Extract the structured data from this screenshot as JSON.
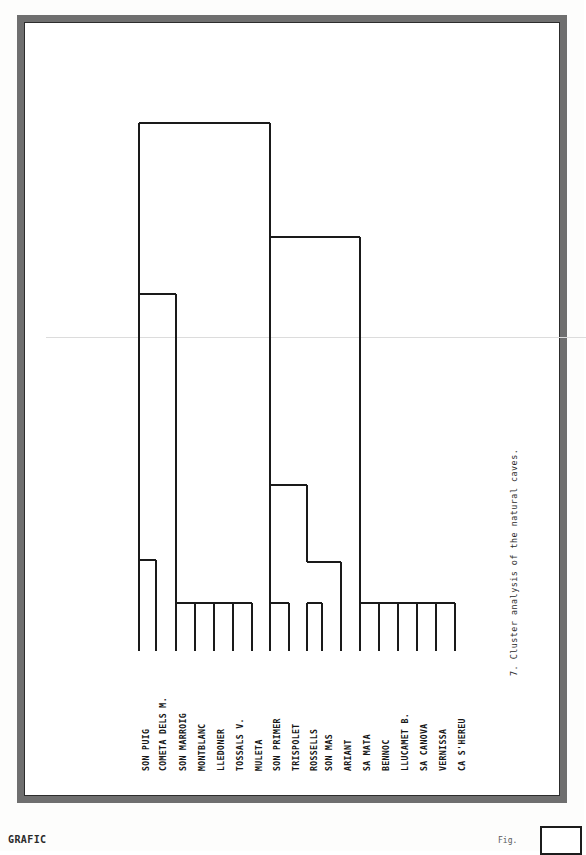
{
  "figure": {
    "caption": "7. Cluster analysis of the natural caves.",
    "leaf_label_count": "18"
  },
  "artifacts": {
    "left_text": "GRAFIC",
    "right_text": "Fig."
  },
  "chart_data": {
    "type": "dendrogram",
    "title": "7. Cluster analysis of the natural caves.",
    "xlabel": "",
    "ylabel": "",
    "grid": false,
    "legend": "none",
    "orientation": "leaves-at-bottom",
    "leaves": [
      "SON PUIG",
      "COMETA DELS M.",
      "SON MARROIG",
      "MONTBLANC",
      "LLEDONER",
      "TOSSALS V.",
      "MULETA",
      "SON PRIMER",
      "TRISPOLET",
      "ROSSELLS",
      "SON MAS",
      "ARIANT",
      "SA MATA",
      "BENNOC",
      "LLUCAMET B.",
      "SA CANOVA",
      "VERNISSA",
      "CA S'HEREU"
    ],
    "leaf_x": [
      91,
      108,
      128,
      147,
      166,
      185,
      204,
      222,
      241,
      259,
      274,
      293,
      312,
      331,
      350,
      369,
      388,
      407
    ],
    "baseline_y": 607,
    "merges": [
      {
        "id": "m1",
        "left": "SON PUIG",
        "right": "COMETA DELS M.",
        "x1": 91,
        "x2": 108,
        "y": 516
      },
      {
        "id": "m2",
        "left": "SON MARROIG",
        "right": "MONTBLANC",
        "x1": 128,
        "x2": 147,
        "y": 559
      },
      {
        "id": "m3",
        "left": "m2",
        "right": "LLEDONER",
        "x1": 137,
        "x2": 166,
        "y": 559
      },
      {
        "id": "m4",
        "left": "m3",
        "right": "TOSSALS V.",
        "x1": 150,
        "x2": 185,
        "y": 559
      },
      {
        "id": "m5",
        "left": "m4",
        "right": "MULETA",
        "x1": 160,
        "x2": 204,
        "y": 559
      },
      {
        "id": "m6",
        "left": "m1",
        "right": "m5",
        "x1": 99,
        "x2": 128,
        "y": 250
      },
      {
        "id": "m7",
        "left": "SON PRIMER",
        "right": "TRISPOLET",
        "x1": 222,
        "x2": 241,
        "y": 559
      },
      {
        "id": "m8",
        "left": "ROSSELLS",
        "right": "SON MAS",
        "x1": 259,
        "x2": 274,
        "y": 559
      },
      {
        "id": "m9",
        "left": "m8",
        "right": "ARIANT",
        "x1": 266,
        "x2": 293,
        "y": 518
      },
      {
        "id": "m10",
        "left": "m7",
        "right": "m9",
        "x1": 231,
        "x2": 275,
        "y": 441
      },
      {
        "id": "m11",
        "left": "SA MATA",
        "right": "BENNOC",
        "x1": 312,
        "x2": 331,
        "y": 559
      },
      {
        "id": "m12",
        "left": "m11",
        "right": "LLUCAMET B.",
        "x1": 321,
        "x2": 350,
        "y": 559
      },
      {
        "id": "m13",
        "left": "m12",
        "right": "SA CANOVA",
        "x1": 333,
        "x2": 369,
        "y": 559
      },
      {
        "id": "m14",
        "left": "m13",
        "right": "VERNISSA",
        "x1": 345,
        "x2": 388,
        "y": 559
      },
      {
        "id": "m15",
        "left": "m14",
        "right": "CA S'HEREU",
        "x1": 356,
        "x2": 407,
        "y": 559
      },
      {
        "id": "m16",
        "left": "m10",
        "right": "m15",
        "x1": 231,
        "x2": 312,
        "y": 193
      },
      {
        "id": "m17_root",
        "left": "m6",
        "right": "m16",
        "x1": 99,
        "x2": 231,
        "y": 79
      }
    ],
    "segments": [
      {
        "type": "h",
        "x1": 91,
        "x2": 108,
        "y": 516
      },
      {
        "type": "v",
        "x": 91,
        "y1": 516,
        "y2": 607
      },
      {
        "type": "v",
        "x": 108,
        "y1": 516,
        "y2": 607
      },
      {
        "type": "h",
        "x1": 128,
        "x2": 204,
        "y": 559
      },
      {
        "type": "v",
        "x": 128,
        "y1": 559,
        "y2": 607
      },
      {
        "type": "v",
        "x": 147,
        "y1": 559,
        "y2": 607
      },
      {
        "type": "v",
        "x": 166,
        "y1": 559,
        "y2": 607
      },
      {
        "type": "v",
        "x": 185,
        "y1": 559,
        "y2": 607
      },
      {
        "type": "v",
        "x": 204,
        "y1": 559,
        "y2": 607
      },
      {
        "type": "h",
        "x1": 91,
        "x2": 128,
        "y": 250
      },
      {
        "type": "v",
        "x": 91,
        "y1": 250,
        "y2": 516
      },
      {
        "type": "v",
        "x": 128,
        "y1": 250,
        "y2": 559
      },
      {
        "type": "h",
        "x1": 222,
        "x2": 241,
        "y": 559
      },
      {
        "type": "v",
        "x": 222,
        "y1": 559,
        "y2": 607
      },
      {
        "type": "v",
        "x": 241,
        "y1": 559,
        "y2": 607
      },
      {
        "type": "h",
        "x1": 259,
        "x2": 274,
        "y": 559
      },
      {
        "type": "v",
        "x": 259,
        "y1": 559,
        "y2": 607
      },
      {
        "type": "v",
        "x": 274,
        "y1": 559,
        "y2": 607
      },
      {
        "type": "h",
        "x1": 259,
        "x2": 293,
        "y": 518
      },
      {
        "type": "v",
        "x": 293,
        "y1": 518,
        "y2": 607
      },
      {
        "type": "h",
        "x1": 222,
        "x2": 259,
        "y": 441
      },
      {
        "type": "v",
        "x": 222,
        "y1": 441,
        "y2": 559
      },
      {
        "type": "v",
        "x": 259,
        "y1": 441,
        "y2": 518
      },
      {
        "type": "h",
        "x1": 312,
        "x2": 407,
        "y": 559
      },
      {
        "type": "v",
        "x": 312,
        "y1": 559,
        "y2": 607
      },
      {
        "type": "v",
        "x": 331,
        "y1": 559,
        "y2": 607
      },
      {
        "type": "v",
        "x": 350,
        "y1": 559,
        "y2": 607
      },
      {
        "type": "v",
        "x": 369,
        "y1": 559,
        "y2": 607
      },
      {
        "type": "v",
        "x": 388,
        "y1": 559,
        "y2": 607
      },
      {
        "type": "v",
        "x": 407,
        "y1": 559,
        "y2": 607
      },
      {
        "type": "h",
        "x1": 222,
        "x2": 312,
        "y": 193
      },
      {
        "type": "v",
        "x": 222,
        "y1": 193,
        "y2": 441
      },
      {
        "type": "v",
        "x": 312,
        "y1": 193,
        "y2": 559
      },
      {
        "type": "h",
        "x1": 91,
        "x2": 222,
        "y": 79
      },
      {
        "type": "v",
        "x": 91,
        "y1": 79,
        "y2": 250
      },
      {
        "type": "v",
        "x": 222,
        "y1": 79,
        "y2": 193
      }
    ]
  }
}
